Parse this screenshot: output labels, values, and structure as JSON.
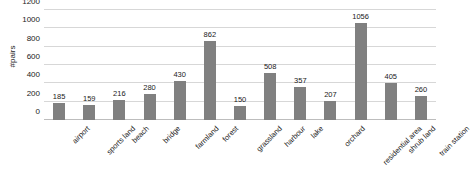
{
  "chart_data": {
    "type": "bar",
    "title": "",
    "xlabel": "",
    "ylabel": "#pairs",
    "ylim": [
      0,
      1200
    ],
    "yticks": [
      0,
      200,
      400,
      600,
      800,
      1000,
      1200
    ],
    "grid": true,
    "legend": false,
    "bar_color": "#808080",
    "gridline_color": "#d7d7d7",
    "categories": [
      "airport",
      "sports land",
      "beach",
      "bridge",
      "farmland",
      "forest",
      "grassland",
      "harbour",
      "lake",
      "orchard",
      "residential area",
      "shrub land",
      "train station"
    ],
    "values": [
      185,
      159,
      216,
      280,
      430,
      862,
      150,
      508,
      357,
      207,
      1056,
      405,
      260
    ]
  }
}
